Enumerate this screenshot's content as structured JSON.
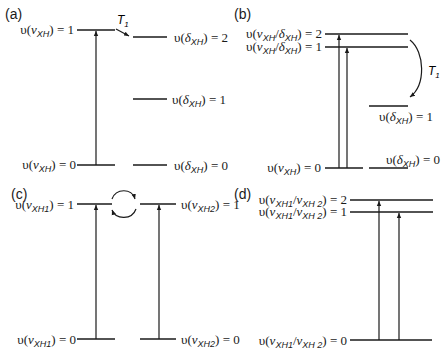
{
  "panels": {
    "a": {
      "label": "(a)",
      "levels": {
        "stretch_1": {
          "prefix": "υ(",
          "greek": "ν",
          "sub": "XH",
          "suffix": ") = 1"
        },
        "stretch_0": {
          "prefix": "υ(",
          "greek": "ν",
          "sub": "XH",
          "suffix": ") = 0"
        },
        "bend_2": {
          "prefix": "υ(",
          "greek": "δ",
          "sub": "XH",
          "suffix": ") = 2"
        },
        "bend_1": {
          "prefix": "υ(",
          "greek": "δ",
          "sub": "XH",
          "suffix": ") = 1"
        },
        "bend_0": {
          "prefix": "υ(",
          "greek": "δ",
          "sub": "XH",
          "suffix": ") = 0"
        }
      },
      "relaxation": {
        "symbol": "T",
        "sub": "1"
      }
    },
    "b": {
      "label": "(b)",
      "levels": {
        "mixed_2": {
          "prefix": "υ(",
          "greek": "ν",
          "sub": "XH",
          "mid": "/",
          "greek2": "δ",
          "sub2": "XH",
          "suffix": ") = 2"
        },
        "mixed_1": {
          "prefix": "υ(",
          "greek": "ν",
          "sub": "XH",
          "mid": "/",
          "greek2": "δ",
          "sub2": "XH",
          "suffix": ") = 1"
        },
        "stretch_0": {
          "prefix": "υ(",
          "greek": "ν",
          "sub": "XH",
          "suffix": ") = 0"
        },
        "bend_1": {
          "prefix": "υ(",
          "greek": "δ",
          "sub": "XH",
          "suffix": ") = 1"
        },
        "bend_0": {
          "prefix": "υ(",
          "greek": "δ",
          "sub": "XH",
          "suffix": ") = 0"
        }
      },
      "relaxation": {
        "symbol": "T",
        "sub": "1"
      }
    },
    "c": {
      "label": "(c)",
      "levels": {
        "xh1_1": {
          "prefix": "υ(",
          "greek": "ν",
          "sub": "XH1",
          "suffix": ") = 1"
        },
        "xh2_1": {
          "prefix": "υ(",
          "greek": "ν",
          "sub": "XH2",
          "suffix": ") = 1"
        },
        "xh1_0": {
          "prefix": "υ(",
          "greek": "ν",
          "sub": "XH1",
          "suffix": ") = 0"
        },
        "xh2_0": {
          "prefix": "υ(",
          "greek": "ν",
          "sub": "XH2",
          "suffix": ") = 0"
        }
      }
    },
    "d": {
      "label": "(d)",
      "levels": {
        "mixed_2": {
          "prefix": "υ(",
          "greek": "ν",
          "sub": "XH1",
          "mid": "/",
          "greek2": "ν",
          "sub2": "XH 2",
          "suffix": ") = 2"
        },
        "mixed_1": {
          "prefix": "υ(",
          "greek": "ν",
          "sub": "XH1",
          "mid": "/",
          "greek2": "ν",
          "sub2": "XH 2",
          "suffix": ") = 1"
        },
        "mixed_0": {
          "prefix": "υ(",
          "greek": "ν",
          "sub": "XH1",
          "mid": "/",
          "greek2": "ν",
          "sub2": "XH 2",
          "suffix": ") = 0"
        }
      }
    }
  }
}
